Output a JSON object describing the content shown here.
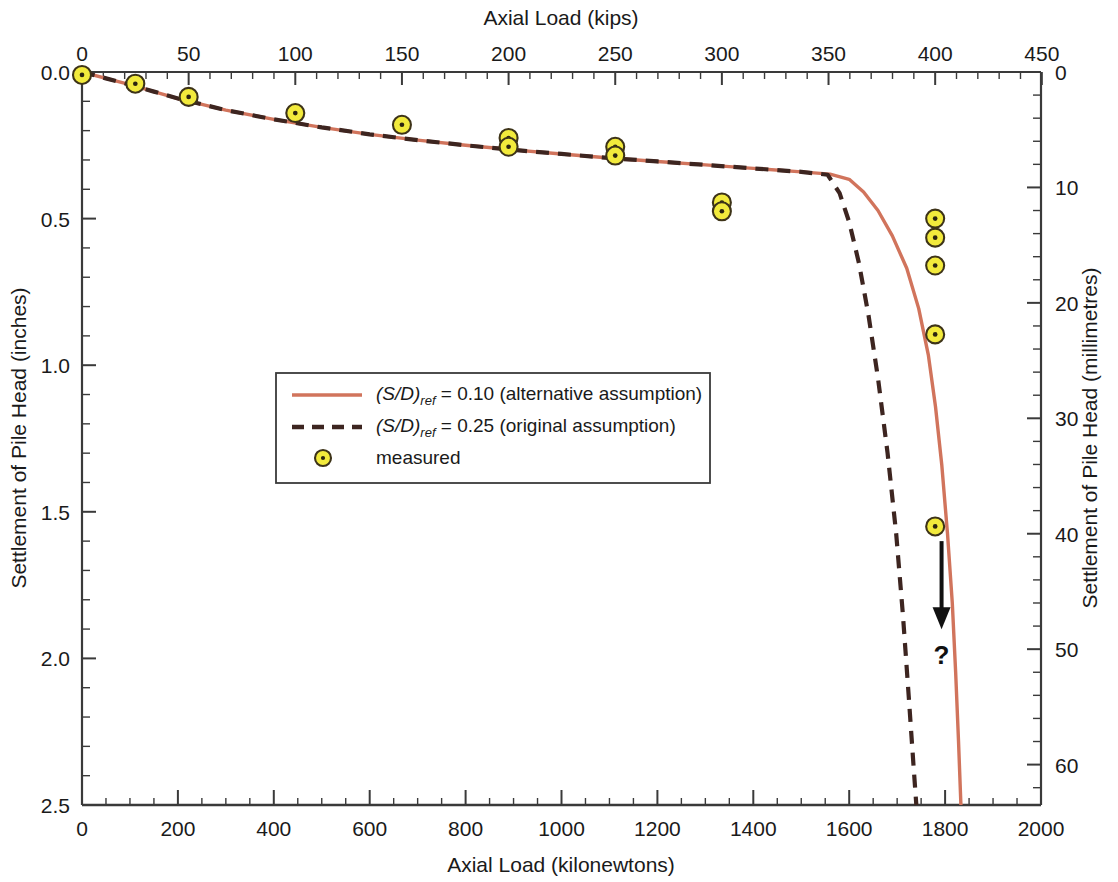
{
  "chart_data": {
    "type": "line",
    "title": "",
    "axes": {
      "top": {
        "label": "Axial Load (kips)",
        "ticks": [
          0,
          50,
          100,
          150,
          200,
          250,
          300,
          350,
          400,
          450
        ],
        "range": [
          0,
          450
        ],
        "minor_per_major": 5
      },
      "bottom": {
        "label": "Axial Load (kilonewtons)",
        "ticks": [
          0,
          200,
          400,
          600,
          800,
          1000,
          1200,
          1400,
          1600,
          1800,
          2000
        ],
        "range": [
          0,
          2000
        ],
        "minor_per_major": 4
      },
      "left": {
        "label": "Settlement of Pile Head (inches)",
        "ticks": [
          "0.0",
          "0.5",
          "1.0",
          "1.5",
          "2.0",
          "2.5"
        ],
        "range": [
          0,
          2.5
        ],
        "minor_per_major": 5
      },
      "right": {
        "label": "Settlement of Pile Head (millimetres)",
        "ticks": [
          0,
          10,
          20,
          30,
          40,
          50,
          60
        ],
        "range": [
          0,
          63.5
        ],
        "minor_per_major": 5
      }
    },
    "grid": false,
    "legend": {
      "position": "center-left",
      "entries": [
        {
          "style": "solid",
          "color": "#d1745c",
          "prefix": "(S/D)",
          "sub": "ref",
          "suffix": " = 0.10 (alternative assumption)",
          "text": "(S/D)ref = 0.10 (alternative assumption)"
        },
        {
          "style": "dashed",
          "color": "#3d2520",
          "prefix": "(S/D)",
          "sub": "ref",
          "suffix": " = 0.25 (original assumption)",
          "text": "(S/D)ref = 0.25 (original assumption)"
        },
        {
          "style": "marker",
          "color": "#f2ea3c",
          "text": "measured"
        }
      ]
    },
    "series": [
      {
        "name": "(S/D)ref = 0.10 (alternative assumption)",
        "style": "solid",
        "color": "#d1745c",
        "points_kN_mm": [
          [
            0,
            0.0
          ],
          [
            50,
            0.55
          ],
          [
            100,
            1.1
          ],
          [
            150,
            1.7
          ],
          [
            200,
            2.3
          ],
          [
            300,
            3.3
          ],
          [
            400,
            4.1
          ],
          [
            500,
            4.8
          ],
          [
            600,
            5.4
          ],
          [
            700,
            5.9
          ],
          [
            800,
            6.35
          ],
          [
            900,
            6.75
          ],
          [
            1000,
            7.1
          ],
          [
            1100,
            7.45
          ],
          [
            1200,
            7.75
          ],
          [
            1300,
            8.05
          ],
          [
            1400,
            8.35
          ],
          [
            1500,
            8.65
          ],
          [
            1560,
            8.85
          ],
          [
            1600,
            9.3
          ],
          [
            1630,
            10.4
          ],
          [
            1660,
            12.0
          ],
          [
            1690,
            14.2
          ],
          [
            1720,
            17.0
          ],
          [
            1745,
            20.5
          ],
          [
            1765,
            24.5
          ],
          [
            1780,
            29.0
          ],
          [
            1793,
            34.0
          ],
          [
            1805,
            40.0
          ],
          [
            1815,
            46.0
          ],
          [
            1822,
            52.0
          ],
          [
            1828,
            58.0
          ],
          [
            1833,
            63.5
          ]
        ]
      },
      {
        "name": "(S/D)ref = 0.25 (original assumption)",
        "style": "dashed",
        "color": "#3d2520",
        "points_kN_mm": [
          [
            0,
            0.0
          ],
          [
            50,
            0.55
          ],
          [
            100,
            1.1
          ],
          [
            150,
            1.7
          ],
          [
            200,
            2.3
          ],
          [
            300,
            3.3
          ],
          [
            400,
            4.1
          ],
          [
            500,
            4.8
          ],
          [
            600,
            5.4
          ],
          [
            700,
            5.9
          ],
          [
            800,
            6.35
          ],
          [
            900,
            6.75
          ],
          [
            1000,
            7.1
          ],
          [
            1100,
            7.45
          ],
          [
            1200,
            7.75
          ],
          [
            1300,
            8.05
          ],
          [
            1400,
            8.35
          ],
          [
            1500,
            8.65
          ],
          [
            1555,
            8.9
          ],
          [
            1580,
            10.5
          ],
          [
            1600,
            13.0
          ],
          [
            1620,
            16.5
          ],
          [
            1640,
            21.0
          ],
          [
            1660,
            26.5
          ],
          [
            1680,
            33.0
          ],
          [
            1698,
            40.0
          ],
          [
            1712,
            47.0
          ],
          [
            1724,
            54.0
          ],
          [
            1734,
            60.0
          ],
          [
            1740,
            63.5
          ]
        ]
      },
      {
        "name": "measured",
        "style": "scatter",
        "marker_fill": "#f2ea3c",
        "marker_edge": "#3d3318",
        "points_kips_in": [
          [
            0,
            0.01
          ],
          [
            25,
            0.04
          ],
          [
            50,
            0.085
          ],
          [
            100,
            0.14
          ],
          [
            150,
            0.18
          ],
          [
            200,
            0.225
          ],
          [
            200,
            0.255
          ],
          [
            250,
            0.255
          ],
          [
            250,
            0.285
          ],
          [
            300,
            0.445
          ],
          [
            300,
            0.475
          ],
          [
            400,
            0.5
          ],
          [
            400,
            0.565
          ],
          [
            400,
            0.66
          ],
          [
            400,
            0.895
          ],
          [
            400,
            1.55
          ]
        ]
      }
    ],
    "annotations": [
      {
        "type": "arrow",
        "text": "?",
        "direction": "down",
        "x_kips": 403,
        "y_start_in": 1.6,
        "y_end_in": 1.88,
        "label_y_in": 2.0
      }
    ]
  },
  "figure": {
    "background": "#ffffff",
    "axis_color": "#3a3a3a",
    "legend_border": "#3a3a3a"
  }
}
